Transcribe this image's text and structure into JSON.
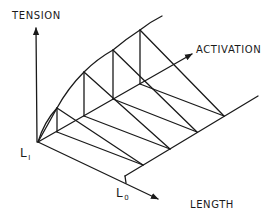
{
  "diagram": {
    "type": "3d-surface-sketch",
    "axes": {
      "vertical": "TENSION",
      "depth": "ACTIVATION",
      "horizontal": "LENGTH"
    },
    "labels": {
      "l1_main": "L",
      "l1_sub": "I",
      "l0_main": "L",
      "l0_sub": "0"
    },
    "colors": {
      "ink": "#1a1a1a",
      "background": "#ffffff"
    },
    "geometry": {
      "origin_L1": [
        38,
        142
      ],
      "tension_arrow_tip": [
        36,
        26
      ],
      "activation_arrow_tip": [
        194,
        53
      ],
      "length_arrow_tip": [
        160,
        200
      ],
      "L0_baseline": [
        [
          125,
          176
        ],
        [
          258,
          96
        ]
      ],
      "activation_points": [
        [
          57,
          132
        ],
        [
          84,
          116
        ],
        [
          113,
          99
        ],
        [
          140,
          84
        ]
      ],
      "curve_tops": [
        [
          57,
          108
        ],
        [
          84,
          72
        ],
        [
          113,
          50
        ],
        [
          140,
          30
        ]
      ],
      "curve_end": [
        162,
        16
      ],
      "L0_points": [
        [
          143,
          165
        ],
        [
          170,
          149
        ],
        [
          197,
          132
        ],
        [
          224,
          116
        ]
      ]
    }
  }
}
